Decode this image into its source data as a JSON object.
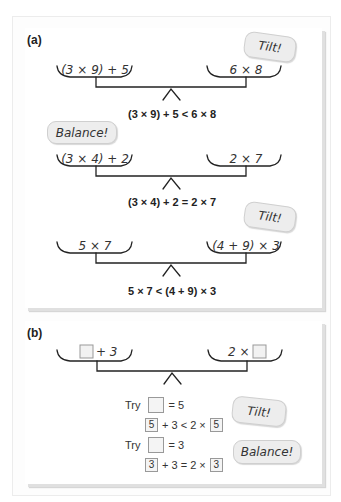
{
  "panel_a": {
    "label": "(a)",
    "scales": [
      {
        "left": "(3 × 9) + 5",
        "right": "6 × 8",
        "equation": "(3 × 9) + 5 < 6 × 8",
        "badge": "Tilt!"
      },
      {
        "left": "(3 × 4) + 2",
        "right": "2 × 7",
        "equation": "(3 × 4) + 2 = 2 × 7",
        "badge": "Balance!"
      },
      {
        "left": "5 × 7",
        "right": "(4 + 9) × 3",
        "equation": "5 × 7 < (4 + 9) × 3",
        "badge": "Tilt!"
      }
    ]
  },
  "panel_b": {
    "label": "(b)",
    "scale": {
      "left_suffix": "+ 3",
      "right_prefix": "2 ×"
    },
    "trials": [
      {
        "try_word": "Try",
        "try_value": "= 5",
        "box_value": "5",
        "middle": "+ 3 < 2 ×",
        "badge": "Tilt!"
      },
      {
        "try_word": "Try",
        "try_value": "= 3",
        "box_value": "3",
        "middle": "+ 3 = 2 ×",
        "badge": "Balance!"
      }
    ]
  },
  "colors": {
    "badge_fill": "#ededed",
    "badge_border": "#cfcfcf",
    "line": "#222222",
    "shadow": "#e0e0e0"
  }
}
